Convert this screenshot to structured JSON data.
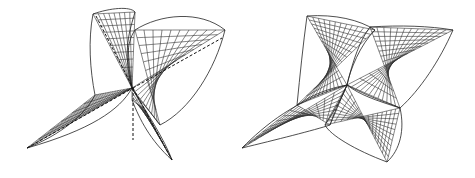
{
  "figure": {
    "panels": [
      {
        "name": "surface-with-axes",
        "description": "Wireframe saddle-like surface with three dashed axes through a central point",
        "line_color": "#333333"
      },
      {
        "name": "surface-dense-mesh",
        "description": "Wireframe four-lobed surface with dense mesh converging to a central point",
        "line_color": "#333333"
      }
    ],
    "background": "#ffffff"
  }
}
